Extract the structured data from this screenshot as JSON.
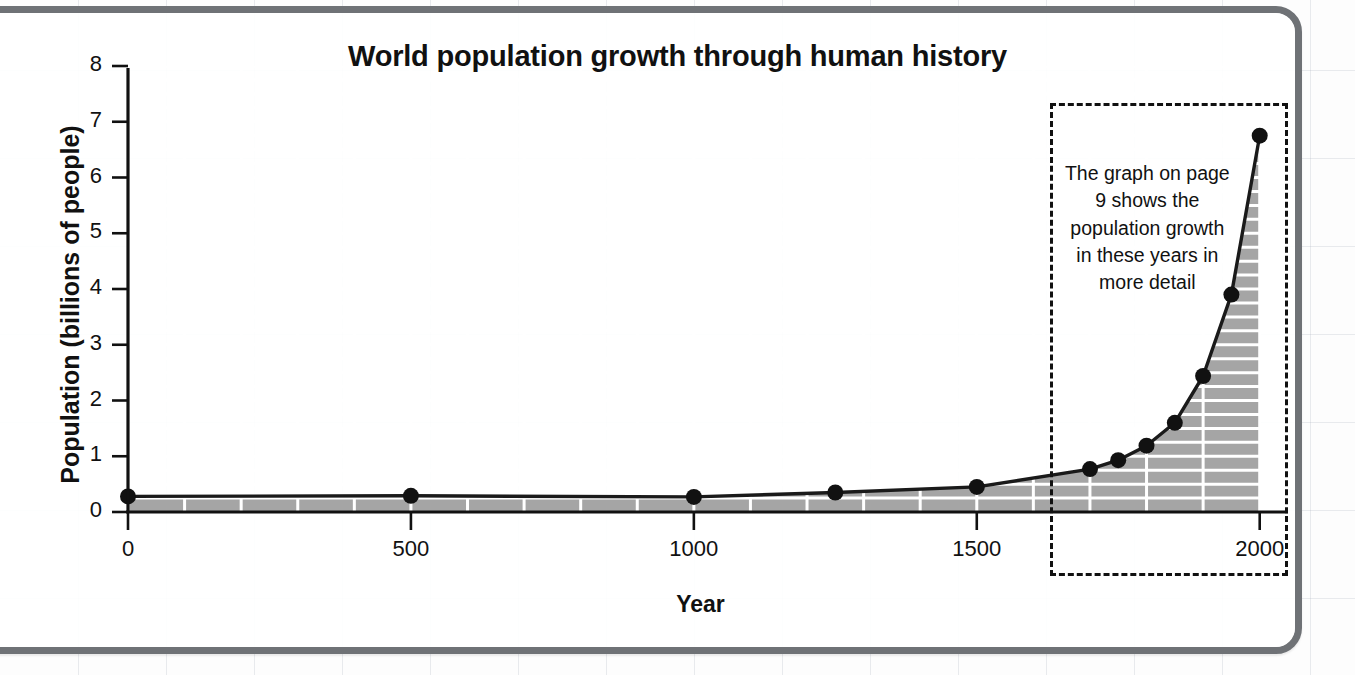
{
  "chart_data": {
    "type": "line",
    "title": "World population growth through human history",
    "xlabel": "Year",
    "ylabel": "Population (billions of people)",
    "xlim": [
      0,
      2050
    ],
    "ylim": [
      0,
      8
    ],
    "grid": true,
    "legend": null,
    "x_ticks": [
      "0",
      "500",
      "1000",
      "1500",
      "2000"
    ],
    "x_tick_values": [
      0,
      500,
      1000,
      1500,
      2000
    ],
    "y_ticks": [
      "0",
      "1",
      "2",
      "3",
      "4",
      "5",
      "6",
      "7",
      "8"
    ],
    "y_tick_values": [
      0,
      1,
      2,
      3,
      4,
      5,
      6,
      7,
      8
    ],
    "series": [
      {
        "name": "World population",
        "fill": true,
        "x": [
          0,
          500,
          1000,
          1250,
          1500,
          1700,
          1750,
          1800,
          1850,
          1900,
          1950,
          2000
        ],
        "values": [
          0.28,
          0.29,
          0.27,
          0.35,
          0.45,
          0.77,
          0.93,
          1.19,
          1.6,
          2.44,
          3.9,
          6.75
        ]
      }
    ],
    "annotations": [
      {
        "name": "page-9-callout",
        "text": "The graph on page 9 shows the population growth in these years in more detail",
        "x_range": [
          1630,
          2050
        ],
        "style": "dashed-box"
      }
    ]
  },
  "colors": {
    "frame": "#6f7276",
    "axis": "#111111",
    "line": "#1a1a1a",
    "fill": "#a5a5a5",
    "grid": "#ffffff",
    "page_grid": "#96a0af",
    "text": "#111111"
  }
}
